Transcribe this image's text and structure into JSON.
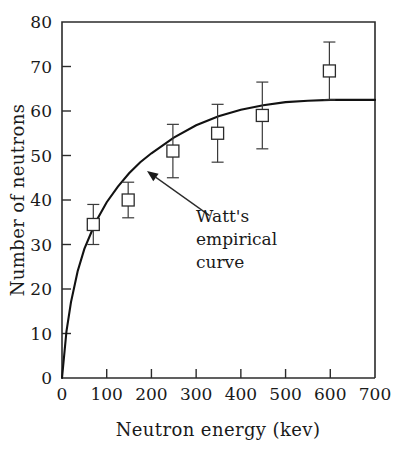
{
  "chart_data": {
    "type": "scatter",
    "title": "",
    "xlabel": "Neutron energy (kev)",
    "ylabel": "Number of neutrons",
    "xlim": [
      0,
      700
    ],
    "ylim": [
      0,
      80
    ],
    "xticks": [
      0,
      100,
      200,
      300,
      400,
      500,
      600,
      700
    ],
    "yticks": [
      0,
      10,
      20,
      30,
      40,
      50,
      60,
      70,
      80
    ],
    "xticklabels": [
      "0",
      "100",
      "200",
      "300",
      "400",
      "500",
      "600",
      "700"
    ],
    "yticklabels": [
      "0",
      "10",
      "20",
      "30",
      "40",
      "50",
      "60",
      "70",
      "80"
    ],
    "grid": false,
    "legend": false,
    "series": [
      {
        "name": "Measured data",
        "marker": "open-square",
        "x": [
          70,
          148,
          248,
          348,
          448,
          598
        ],
        "y": [
          34.5,
          40.0,
          51.0,
          55.0,
          59.0,
          69.0
        ],
        "yerr": [
          4.5,
          4.0,
          6.0,
          6.5,
          7.5,
          6.5
        ]
      },
      {
        "name": "Watt's empirical curve",
        "marker": "none",
        "line": "solid",
        "x": [
          0,
          10,
          20,
          35,
          50,
          75,
          100,
          125,
          150,
          175,
          200,
          250,
          300,
          350,
          400,
          450,
          500,
          550,
          600,
          650,
          700
        ],
        "y": [
          0,
          10.5,
          17.0,
          24.0,
          29.0,
          35.0,
          39.5,
          43.0,
          46.0,
          48.5,
          50.5,
          54.0,
          56.8,
          58.8,
          60.3,
          61.3,
          62.0,
          62.3,
          62.5,
          62.5,
          62.5
        ]
      }
    ],
    "annotations": [
      {
        "name": "watts-curve-annotation",
        "lines": [
          "Watt's",
          "empirical",
          "curve"
        ],
        "text": "Watt's empirical curve",
        "arrow_tip": [
          190,
          46.5
        ],
        "arrow_tail": [
          330,
          36.5
        ]
      }
    ],
    "colors": {
      "curve": "#121212",
      "marker_edge": "#2b2b2b",
      "marker_fill": "#ffffff",
      "error_bar": "#3a3a3a",
      "axis": "#2b2b2b",
      "text": "#1a1a1a",
      "background": "#ffffff"
    }
  }
}
